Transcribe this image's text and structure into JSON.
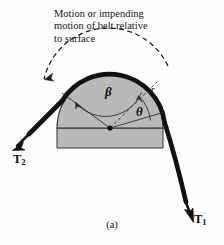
{
  "figure": {
    "caption": "(a)",
    "annotation": {
      "line1": "Motion or impending",
      "line2": "motion of belt relative",
      "line3": "to surface"
    },
    "labels": {
      "beta": "β",
      "theta": "θ",
      "radius": "r",
      "tension_1": "T",
      "tension_1_sub": "1",
      "tension_2": "T",
      "tension_2_sub": "2"
    },
    "colors": {
      "background": "#fdfdfd",
      "drum_fill": "#b9b9b9",
      "drum_outline": "#2b2b2b",
      "belt": "#111111",
      "line": "#2f2f2f",
      "text": "#16161a"
    },
    "geometry": {
      "center_x": 110,
      "center_y": 128,
      "radius": 53,
      "wrap_angle_beta_deg": 105,
      "partial_angle_theta_deg": 42
    }
  }
}
